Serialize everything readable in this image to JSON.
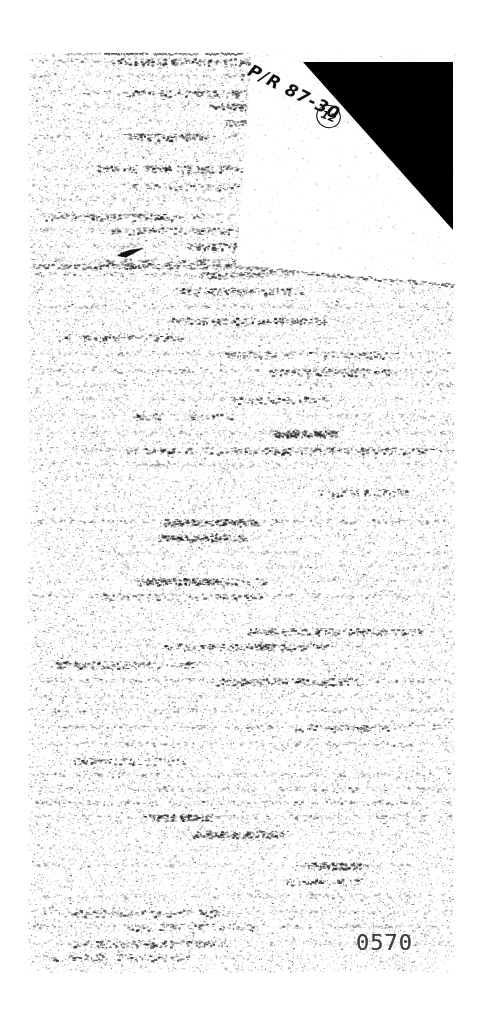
{
  "scan": {
    "annotations": {
      "handwritten_reference": "P/R 87-30",
      "circled_number": "12"
    },
    "stamp": {
      "page_number": "0570"
    },
    "colors": {
      "paper": "#ffffff",
      "handwriting_ink": "#101010",
      "fold_triangle": "#000000",
      "stamp_ink": "#3f3f3f",
      "noise_ink": "#1c1c1c"
    }
  }
}
